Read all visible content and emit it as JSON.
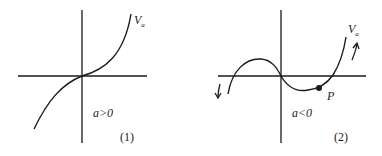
{
  "panels": [
    {
      "id": "1",
      "curve_label": "V",
      "curve_label_sub": "a",
      "condition": "a>0",
      "caption": "(1)"
    },
    {
      "id": "2",
      "curve_label": "V",
      "curve_label_sub": "a",
      "condition": "a<0",
      "caption": "(2)",
      "point_label": "P"
    }
  ],
  "colors": {
    "stroke": "#1a1a1a",
    "background": "#ffffff"
  }
}
